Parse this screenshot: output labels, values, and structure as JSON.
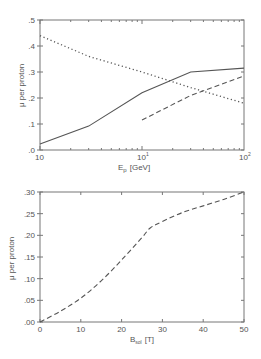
{
  "chart_data": [
    {
      "type": "line",
      "title": "",
      "xlabel": "E_p [GeV]",
      "xlabel_main": "E",
      "xlabel_sub": "p",
      "xlabel_unit": "[GeV]",
      "ylabel": "μ per proton",
      "xscale": "log",
      "xlim": [
        1,
        100
      ],
      "ylim": [
        0,
        0.5
      ],
      "x_tick_labels": [
        {
          "value": 1,
          "base": "10",
          "exp": "0",
          "label": "10"
        },
        {
          "value": 10,
          "base": "10",
          "exp": "1",
          "label": "10¹"
        },
        {
          "value": 100,
          "base": "10",
          "exp": "2",
          "label": "10²"
        }
      ],
      "y_tick_labels": [
        ".0",
        ".1",
        ".2",
        ".3",
        ".4",
        ".5"
      ],
      "y_ticks": [
        0,
        0.1,
        0.2,
        0.3,
        0.4,
        0.5
      ],
      "grid": false,
      "legend": null,
      "series": [
        {
          "name": "solid",
          "style": "solid",
          "x": [
            1,
            3,
            10,
            30,
            100
          ],
          "values": [
            0.023,
            0.092,
            0.22,
            0.3,
            0.315
          ]
        },
        {
          "name": "dashed",
          "style": "dashed",
          "x": [
            10,
            30,
            100
          ],
          "values": [
            0.115,
            0.21,
            0.285
          ]
        },
        {
          "name": "dotted",
          "style": "dotted",
          "x": [
            1,
            3,
            10,
            30,
            100
          ],
          "values": [
            0.44,
            0.36,
            0.3,
            0.24,
            0.18
          ]
        }
      ]
    },
    {
      "type": "line",
      "title": "",
      "xlabel": "B_sol [T]",
      "xlabel_main": "B",
      "xlabel_sub": "sol",
      "xlabel_unit": "[T]",
      "ylabel": "μ per proton",
      "xscale": "linear",
      "xlim": [
        0,
        50
      ],
      "ylim": [
        0,
        0.3
      ],
      "x_tick_labels": [
        "0",
        "10",
        "20",
        "30",
        "40",
        "50"
      ],
      "x_ticks": [
        0,
        10,
        20,
        30,
        40,
        50
      ],
      "y_tick_labels": [
        ".00",
        ".05",
        ".10",
        ".15",
        ".20",
        ".25",
        ".30"
      ],
      "y_ticks": [
        0,
        0.05,
        0.1,
        0.15,
        0.2,
        0.25,
        0.3
      ],
      "grid": false,
      "legend": null,
      "series": [
        {
          "name": "dashed",
          "style": "dashed",
          "x": [
            0,
            5,
            10,
            15,
            20,
            25,
            27,
            30,
            35,
            40,
            45,
            50
          ],
          "values": [
            0.0,
            0.025,
            0.055,
            0.095,
            0.143,
            0.195,
            0.217,
            0.232,
            0.253,
            0.268,
            0.283,
            0.3
          ]
        }
      ]
    }
  ],
  "colors": {
    "axes": "#777777",
    "line": "#555555",
    "text": "#555555",
    "background": "#ffffff"
  }
}
